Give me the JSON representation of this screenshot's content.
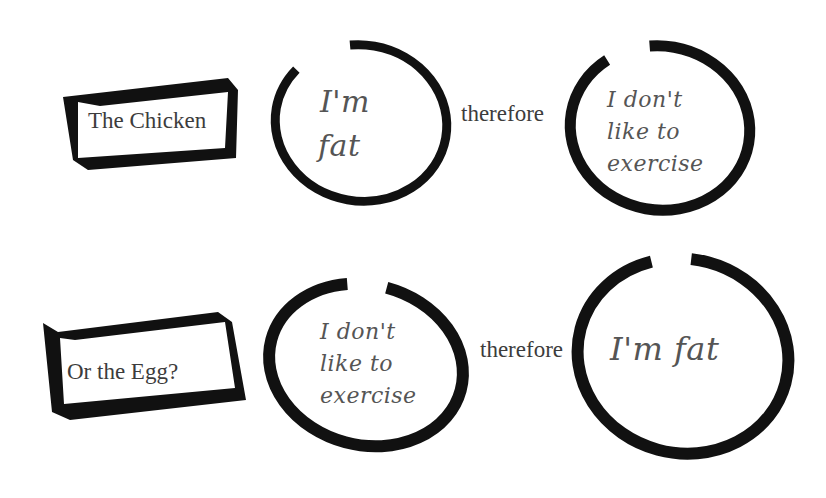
{
  "rows": [
    {
      "label": "The Chicken",
      "cause": [
        "I'm",
        "fat"
      ],
      "connector": "therefore",
      "effect": [
        "I don't",
        "like to",
        "exercise"
      ]
    },
    {
      "label": "Or the Egg?",
      "cause": [
        "I don't",
        "like to",
        "exercise"
      ],
      "connector": "therefore",
      "effect": [
        "I'm fat"
      ]
    }
  ],
  "colors": {
    "ink": "#111111",
    "text": "#3c3c3c",
    "handwriting": "#555555",
    "background": "#ffffff"
  }
}
